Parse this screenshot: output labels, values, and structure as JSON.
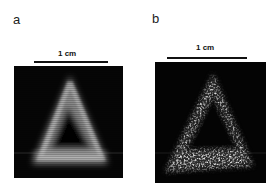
{
  "figure": {
    "panels": [
      {
        "label": "a",
        "scale_bar_text": "1 cm",
        "image_description": "blurred fluorescence image of a triangular ring"
      },
      {
        "label": "b",
        "scale_bar_text": "1 cm",
        "image_description": "speckled high-resolution image of a triangular ring"
      }
    ],
    "colors": {
      "background": "#ffffff",
      "image_background": "#050505",
      "signal": "#d8d8d8",
      "scale_bar": "#111111"
    }
  }
}
